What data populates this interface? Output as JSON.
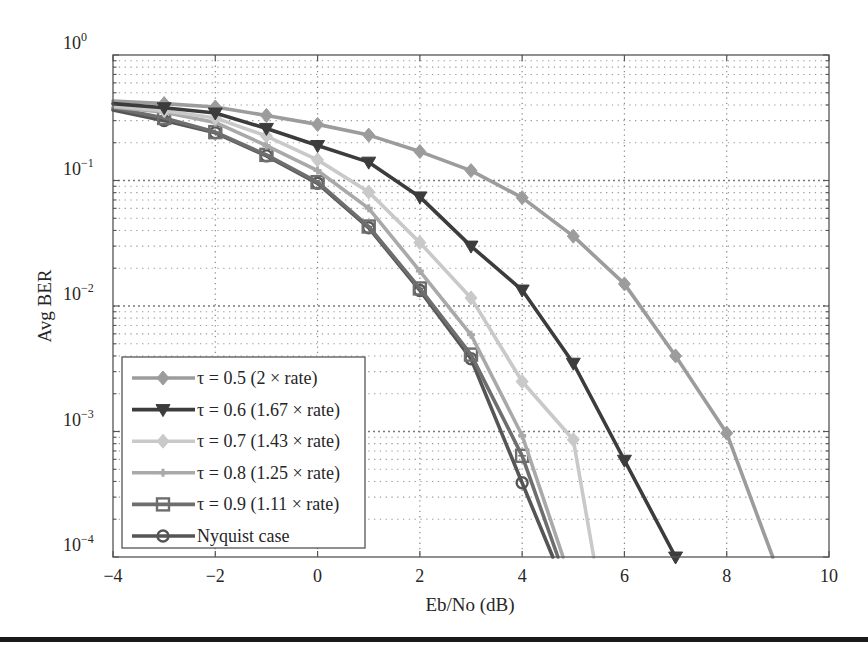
{
  "chart_data": {
    "type": "line",
    "title": "",
    "xlabel": "Eb/No (dB)",
    "ylabel": "Avg BER",
    "xlim": [
      -4,
      10
    ],
    "ylim": [
      0.0001,
      1
    ],
    "yscale": "log",
    "grid": true,
    "legend_position": "lower left",
    "x_ticks": [
      -4,
      -2,
      0,
      2,
      4,
      6,
      8,
      10
    ],
    "x_tick_labels": [
      "−4",
      "−2",
      "0",
      "2",
      "4",
      "6",
      "8",
      "10"
    ],
    "y_ticks": [
      1,
      0.1,
      0.01,
      0.001,
      0.0001
    ],
    "y_tick_labels": [
      {
        "base": "10",
        "exp": "0"
      },
      {
        "base": "10",
        "exp": "−1"
      },
      {
        "base": "10",
        "exp": "−2"
      },
      {
        "base": "10",
        "exp": "−3"
      },
      {
        "base": "10",
        "exp": "−4"
      }
    ],
    "series": [
      {
        "name": "τ = 0.5 (2 × rate)",
        "color": "#9c9c9c",
        "marker": "diamond",
        "x": [
          -4,
          -3,
          -2,
          -1,
          0,
          1,
          2,
          3,
          4,
          5,
          6,
          7,
          8,
          8.9
        ],
        "values": [
          0.43,
          0.41,
          0.385,
          0.33,
          0.28,
          0.23,
          0.17,
          0.12,
          0.073,
          0.036,
          0.015,
          0.004,
          0.00097,
          0.0001
        ]
      },
      {
        "name": "τ = 0.6 (1.67 × rate)",
        "color": "#3c3c3c",
        "marker": "triangle-down",
        "x": [
          -4,
          -3,
          -2,
          -1,
          0,
          1,
          2,
          3,
          4,
          5,
          6,
          7
        ],
        "values": [
          0.41,
          0.38,
          0.345,
          0.26,
          0.19,
          0.14,
          0.074,
          0.03,
          0.0134,
          0.0035,
          0.00059,
          0.0001
        ]
      },
      {
        "name": "τ = 0.7 (1.43 × rate)",
        "color": "#c9c9c9",
        "marker": "diamond",
        "x": [
          -4,
          -3,
          -2,
          -1,
          0,
          1,
          2,
          3,
          4,
          5,
          5.4
        ],
        "values": [
          0.39,
          0.36,
          0.315,
          0.226,
          0.146,
          0.081,
          0.032,
          0.0116,
          0.0025,
          0.00086,
          0.0001
        ]
      },
      {
        "name": "τ = 0.8 (1.25 × rate)",
        "color": "#a9a9a9",
        "marker": "plus",
        "x": [
          -4,
          -3,
          -2,
          -1,
          0,
          1,
          2,
          3,
          4,
          4.8
        ],
        "values": [
          0.385,
          0.35,
          0.29,
          0.19,
          0.12,
          0.06,
          0.019,
          0.0059,
          0.00093,
          0.0001
        ]
      },
      {
        "name": "τ = 0.9 (1.11 × rate)",
        "color": "#6e6e6e",
        "marker": "square",
        "x": [
          -4,
          -3,
          -2,
          -1,
          0,
          1,
          2,
          3,
          4,
          4.7
        ],
        "values": [
          0.38,
          0.315,
          0.243,
          0.16,
          0.097,
          0.043,
          0.0138,
          0.0041,
          0.00064,
          0.0001
        ]
      },
      {
        "name": "Nyquist case",
        "color": "#555555",
        "marker": "circle",
        "x": [
          -4,
          -3,
          -2,
          -1,
          0,
          1,
          2,
          3,
          4,
          4.6
        ],
        "values": [
          0.365,
          0.3,
          0.24,
          0.157,
          0.095,
          0.042,
          0.0133,
          0.0038,
          0.00039,
          0.0001
        ]
      }
    ]
  },
  "layout": {
    "plot_left": 113,
    "plot_right": 829,
    "plot_top": 55,
    "plot_bottom": 557,
    "legend": {
      "left": 122,
      "top": 357,
      "width": 243,
      "height": 191
    }
  }
}
